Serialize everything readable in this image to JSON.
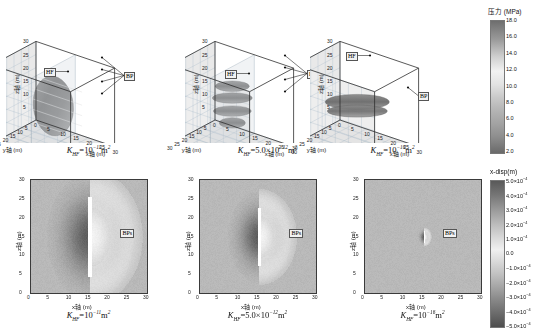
{
  "figure": {
    "background": "#ffffff",
    "width": 546,
    "height": 333
  },
  "chart_data": {
    "type": "heatmap",
    "title": "",
    "panels": [
      {
        "id": "p1",
        "row": "top",
        "kind": "3d-isosurface",
        "caption_prefix": "K",
        "caption_sub": "HF",
        "caption_eq": "=10",
        "caption_exp": "-11",
        "caption_unit": "m",
        "caption_unit_exp": "2",
        "caption_text": "KHF=10-11m2",
        "xlabel": "x轴 (m)",
        "ylabel": "y轴 (m)",
        "zlabel": "z轴 (m)",
        "xticks": [
          0,
          5,
          10,
          15,
          20,
          25,
          30
        ],
        "yticks": [
          0,
          5,
          10,
          15,
          20,
          25,
          30
        ],
        "zticks": [
          0,
          5,
          10,
          15,
          20,
          25,
          30
        ],
        "xlim": [
          0,
          30
        ],
        "ylim": [
          0,
          30
        ],
        "zlim": [
          0,
          30
        ],
        "annotations": [
          {
            "label": "HF",
            "meaning": "hydraulic fracture"
          },
          {
            "label": "BP",
            "meaning": "bedding plane"
          }
        ],
        "feature": "single large ellipsoidal pressure iso-surface centred near x=15, z=15"
      },
      {
        "id": "p2",
        "row": "top",
        "kind": "3d-isosurface",
        "caption_prefix": "K",
        "caption_sub": "HF",
        "caption_eq": "=5.0×10",
        "caption_exp": "-12",
        "caption_unit": "m",
        "caption_unit_exp": "2",
        "caption_text": "KHF=5.0×10-12m2",
        "xlabel": "x轴 (m)",
        "ylabel": "y轴 (m)",
        "zlabel": "z轴 (m)",
        "xticks": [
          0,
          5,
          10,
          15,
          20,
          25,
          30
        ],
        "yticks": [
          0,
          5,
          10,
          15,
          20,
          25,
          30
        ],
        "zticks": [
          0,
          5,
          10,
          15,
          20,
          25,
          30
        ],
        "xlim": [
          0,
          30
        ],
        "ylim": [
          0,
          30
        ],
        "zlim": [
          0,
          30
        ],
        "annotations": [
          {
            "label": "HF",
            "meaning": "hydraulic fracture"
          },
          {
            "label": "BP",
            "meaning": "bedding plane"
          }
        ],
        "feature": "four stacked horizontal disc-shaped iso-surfaces along bedding planes"
      },
      {
        "id": "p3",
        "row": "top",
        "kind": "3d-isosurface",
        "caption_prefix": "K",
        "caption_sub": "HF",
        "caption_eq": "=10",
        "caption_exp": "-16",
        "caption_unit": "m",
        "caption_unit_exp": "2",
        "caption_text": "KHF=10-16m2",
        "xlabel": "x轴 (m)",
        "ylabel": "y轴 (m)",
        "zlabel": "z轴 (m)",
        "xticks": [
          0,
          5,
          10,
          15,
          20,
          25,
          30
        ],
        "yticks": [
          0,
          5,
          10,
          15,
          20,
          25,
          30
        ],
        "zticks": [
          0,
          5,
          10,
          15,
          20,
          25,
          30
        ],
        "xlim": [
          0,
          30
        ],
        "ylim": [
          0,
          30
        ],
        "zlim": [
          0,
          30
        ],
        "annotations": [
          {
            "label": "HF",
            "meaning": "hydraulic fracture"
          },
          {
            "label": "BP",
            "meaning": "bedding plane"
          }
        ],
        "feature": "wide flat merged horizontal pressure sheet spanning the domain"
      },
      {
        "id": "p4",
        "row": "bottom",
        "kind": "2d-slice",
        "caption_prefix": "K",
        "caption_sub": "HF",
        "caption_eq": "=10",
        "caption_exp": "-11",
        "caption_unit": "m",
        "caption_unit_exp": "2",
        "caption_text": "KHF=10-11m2",
        "xlabel": "x轴 (m)",
        "ylabel": "z轴 (m)",
        "xticks": [
          0,
          5,
          10,
          15,
          20,
          25,
          30
        ],
        "yticks": [
          0,
          5,
          10,
          15,
          20,
          25,
          30
        ],
        "xlim": [
          0,
          30
        ],
        "ylim": [
          0,
          30
        ],
        "annotations": [
          {
            "label": "BPs",
            "meaning": "bedding planes"
          }
        ],
        "feature": "tall bright vertical fracture at x=15 with broad dark lobe to its left",
        "lobe_scale": 1.0
      },
      {
        "id": "p5",
        "row": "bottom",
        "kind": "2d-slice",
        "caption_prefix": "K",
        "caption_sub": "HF",
        "caption_eq": "=5.0×10",
        "caption_exp": "-12",
        "caption_unit": "m",
        "caption_unit_exp": "2",
        "caption_text": "KHF=5.0×10-12m2",
        "xlabel": "x轴 (m)",
        "ylabel": "z轴 (m)",
        "xticks": [
          0,
          5,
          10,
          15,
          20,
          25,
          30
        ],
        "yticks": [
          0,
          5,
          10,
          15,
          20,
          25,
          30
        ],
        "xlim": [
          0,
          30
        ],
        "ylim": [
          0,
          30
        ],
        "annotations": [
          {
            "label": "BPs",
            "meaning": "bedding planes"
          }
        ],
        "feature": "narrower bright vertical fracture with smaller displacement lobe",
        "lobe_scale": 0.72
      },
      {
        "id": "p6",
        "row": "bottom",
        "kind": "2d-slice",
        "caption_prefix": "K",
        "caption_sub": "HF",
        "caption_eq": "=10",
        "caption_exp": "-16",
        "caption_unit": "m",
        "caption_unit_exp": "2",
        "caption_text": "KHF=10-16m2",
        "xlabel": "x轴 (m)",
        "ylabel": "z轴 (m)",
        "xticks": [
          0,
          5,
          10,
          15,
          20,
          25,
          30
        ],
        "yticks": [
          0,
          5,
          10,
          15,
          20,
          25,
          30
        ],
        "xlim": [
          0,
          30
        ],
        "ylim": [
          0,
          30
        ],
        "annotations": [
          {
            "label": "BPs",
            "meaning": "bedding planes"
          }
        ],
        "feature": "very small compact bright blob near x=16, z=15 on uniform grey background",
        "lobe_scale": 0.14
      }
    ],
    "colorbars": [
      {
        "id": "pressure",
        "title": "压力 (MPa)",
        "unit": "MPa",
        "ticks": [
          "18.0",
          "16.0",
          "14.0",
          "12.0",
          "10.0",
          "8.0",
          "6.0",
          "4.0",
          "2.0"
        ],
        "values": [
          18.0,
          16.0,
          14.0,
          12.0,
          10.0,
          8.0,
          6.0,
          4.0,
          2.0
        ],
        "vmin": 2.0,
        "vmax": 18.0,
        "position": "right-top",
        "colormap": "grey-dark-to-light-to-dark"
      },
      {
        "id": "x-disp",
        "title": "x-disp(m)",
        "unit": "m",
        "ticks": [
          "5.0×10-4",
          "4.0×10-4",
          "3.0×10-4",
          "2.0×10-4",
          "1.0×10-4",
          "0.0",
          "−1.0×10-4",
          "−2.0×10-4",
          "−3.0×10-4",
          "−4.0×10-4",
          "−5.0×10-4"
        ],
        "values": [
          0.0005,
          0.0004,
          0.0003,
          0.0002,
          0.0001,
          0.0,
          -0.0001,
          -0.0002,
          -0.0003,
          -0.0004,
          -0.0005
        ],
        "vmin": -0.0005,
        "vmax": 0.0005,
        "position": "right-bottom",
        "colormap": "grey-diverging"
      }
    ]
  }
}
